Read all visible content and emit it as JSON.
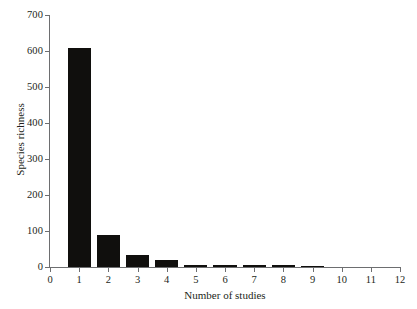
{
  "chart_data": {
    "type": "bar",
    "title": "",
    "subtitle": "",
    "xlabel": "Number of studies",
    "ylabel": "Species richness",
    "categories": [
      1,
      2,
      3,
      4,
      5,
      6,
      7,
      8,
      9,
      10,
      11,
      12
    ],
    "values": [
      607,
      90,
      34,
      19,
      6,
      5,
      5,
      5,
      4,
      0,
      0,
      0
    ],
    "series": [
      {
        "name": "Species richness",
        "values": [
          607,
          90,
          34,
          19,
          6,
          5,
          5,
          5,
          4,
          0,
          0,
          0
        ]
      }
    ],
    "xlim": [
      0,
      12
    ],
    "ylim": [
      0,
      700
    ],
    "x_ticks": [
      "0",
      "1",
      "2",
      "3",
      "4",
      "5",
      "6",
      "7",
      "8",
      "9",
      "10",
      "11",
      "12"
    ],
    "y_ticks": [
      "0",
      "100",
      "200",
      "300",
      "400",
      "500",
      "600",
      "700"
    ],
    "grid": false,
    "legend": false,
    "legend_position": "none",
    "bar_color": "#100f0d",
    "axis_color": "#6d6e70",
    "text_color": "#231f20",
    "background_color": "#ffffff",
    "bar_width_units": 0.8,
    "annotations": []
  }
}
